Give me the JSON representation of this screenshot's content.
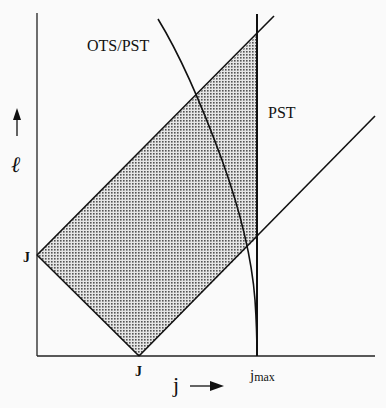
{
  "diagram": {
    "type": "phase-space region diagram",
    "axes": {
      "x": {
        "label": "j",
        "arrow": "right",
        "ticks": [
          "J",
          "jmax"
        ]
      },
      "y": {
        "label": "ℓ",
        "arrow": "up",
        "ticks": [
          "J"
        ]
      }
    },
    "curve_labels": {
      "ots_pst": "OTS/PST",
      "pst": "PST"
    },
    "tick_labels": {
      "y_J": "J",
      "x_J": "J",
      "x_jmax_base": "j",
      "x_jmax_sub": "max"
    },
    "axis_labels": {
      "x": "j",
      "y": "ℓ"
    },
    "elements": [
      "Shaded region bounded by |ℓ − j| ≤ J, ℓ + j ≥ J, j ≤ jmax",
      "Upper diagonal line ℓ = j + J",
      "Lower diagonal line ℓ = j − J",
      "Lower-left diagonal line ℓ + j = J",
      "Vertical line j = jmax labeled PST",
      "Curved boundary labeled OTS/PST ending at jmax on the j-axis"
    ],
    "colors": {
      "line": "#111111",
      "shade": "#9a9a9a",
      "background": "#fafafa"
    }
  }
}
